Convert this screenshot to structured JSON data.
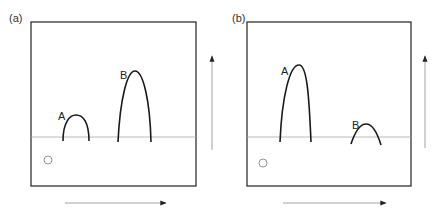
{
  "figure": {
    "panels": [
      {
        "id": "a",
        "label": "(a)",
        "peaks": [
          {
            "label": "A",
            "relative_height": "low"
          },
          {
            "label": "B",
            "relative_height": "high"
          }
        ]
      },
      {
        "id": "b",
        "label": "(b)",
        "peaks": [
          {
            "label": "A",
            "relative_height": "high"
          },
          {
            "label": "B",
            "relative_height": "low"
          }
        ]
      }
    ],
    "origin_marker": "circle",
    "axes": {
      "horizontal_arrow": "right-arrow",
      "vertical_arrow": "up-arrow"
    },
    "colors": {
      "frame": "#333333",
      "curve": "#1a1a1a",
      "baseline": "#999999",
      "arrow": "#999999",
      "arrowhead": "#222222"
    }
  }
}
